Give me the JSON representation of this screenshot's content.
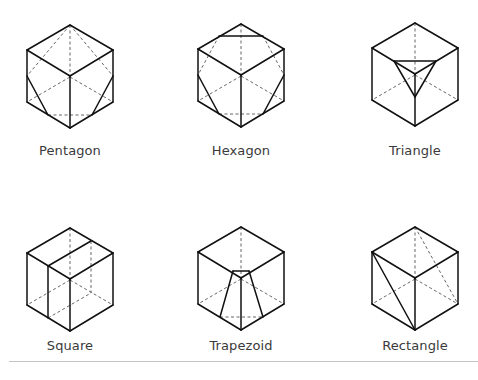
{
  "colors": {
    "solid_edge": "#111111",
    "hidden_edge": "#555555",
    "label_text": "#3a3a3a",
    "divider": "#c4c4c4"
  },
  "cube_template": {
    "vertices": {
      "T": [
        43,
        0
      ],
      "LT": [
        0,
        25
      ],
      "RT": [
        86,
        25
      ],
      "C": [
        43,
        51
      ],
      "LB": [
        0,
        77
      ],
      "RB": [
        86,
        77
      ],
      "B": [
        43,
        103
      ],
      "H": [
        43,
        52
      ]
    },
    "visible_edges": [
      [
        "T",
        "LT"
      ],
      [
        "T",
        "RT"
      ],
      [
        "LT",
        "C"
      ],
      [
        "RT",
        "C"
      ],
      [
        "LT",
        "LB"
      ],
      [
        "RT",
        "RB"
      ],
      [
        "C",
        "B"
      ],
      [
        "LB",
        "B"
      ],
      [
        "RB",
        "B"
      ]
    ],
    "hidden_edges": [
      [
        "T",
        "H"
      ],
      [
        "H",
        "LB"
      ],
      [
        "H",
        "RB"
      ]
    ]
  },
  "cubes": [
    {
      "name": "Pentagon",
      "label": "Pentagon",
      "origin": [
        27,
        25
      ],
      "label_pos": [
        70,
        157
      ],
      "section_solid": [
        [
          [
            0,
            51
          ],
          [
            21,
            90
          ]
        ],
        [
          [
            86,
            51
          ],
          [
            65,
            90
          ]
        ]
      ],
      "section_dashed": [
        [
          [
            43,
            0
          ],
          [
            0,
            51
          ]
        ],
        [
          [
            43,
            0
          ],
          [
            86,
            51
          ]
        ],
        [
          [
            21,
            90
          ],
          [
            65,
            90
          ]
        ]
      ]
    },
    {
      "name": "Hexagon",
      "label": "Hexagon",
      "origin": [
        198,
        24
      ],
      "label_pos": [
        241,
        157
      ],
      "section_solid": [
        [
          [
            21,
            12
          ],
          [
            65,
            12
          ]
        ],
        [
          [
            0,
            51
          ],
          [
            21,
            90
          ]
        ],
        [
          [
            86,
            51
          ],
          [
            65,
            90
          ]
        ]
      ],
      "section_dashed": [
        [
          [
            21,
            12
          ],
          [
            0,
            51
          ]
        ],
        [
          [
            65,
            12
          ],
          [
            86,
            51
          ]
        ],
        [
          [
            21,
            90
          ],
          [
            65,
            90
          ]
        ]
      ]
    },
    {
      "name": "Triangle",
      "label": "Triangle",
      "origin": [
        372,
        23
      ],
      "label_pos": [
        415,
        157
      ],
      "section_solid": [
        [
          [
            22,
            38
          ],
          [
            64,
            38
          ]
        ],
        [
          [
            22,
            38
          ],
          [
            43,
            74
          ]
        ],
        [
          [
            64,
            38
          ],
          [
            43,
            74
          ]
        ]
      ],
      "section_dashed": []
    },
    {
      "name": "Square",
      "label": "Square",
      "origin": [
        27,
        228
      ],
      "label_pos": [
        70,
        352
      ],
      "section_solid": [
        [
          [
            21,
            38
          ],
          [
            64,
            13
          ]
        ],
        [
          [
            21,
            38
          ],
          [
            21,
            90
          ]
        ]
      ],
      "section_dashed": [
        [
          [
            64,
            13
          ],
          [
            64,
            65
          ]
        ],
        [
          [
            21,
            90
          ],
          [
            64,
            65
          ]
        ]
      ]
    },
    {
      "name": "Trapezoid",
      "label": "Trapezoid",
      "origin": [
        198,
        227
      ],
      "label_pos": [
        241,
        352
      ],
      "section_solid": [
        [
          [
            35,
            44
          ],
          [
            51,
            44
          ]
        ],
        [
          [
            35,
            44
          ],
          [
            22,
            90
          ]
        ],
        [
          [
            51,
            44
          ],
          [
            65,
            90
          ]
        ]
      ],
      "section_dashed": [
        [
          [
            22,
            90
          ],
          [
            65,
            90
          ]
        ]
      ]
    },
    {
      "name": "Rectangle",
      "label": "Rectangle",
      "origin": [
        372,
        227
      ],
      "label_pos": [
        415,
        352
      ],
      "section_solid": [
        [
          [
            0,
            25
          ],
          [
            43,
            103
          ]
        ]
      ],
      "section_dashed": [
        [
          [
            43,
            0
          ],
          [
            86,
            77
          ]
        ]
      ]
    }
  ]
}
